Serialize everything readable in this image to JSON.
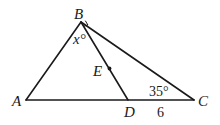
{
  "diagram": {
    "type": "geometry-triangle",
    "points": {
      "A": {
        "label": "A",
        "x": 26,
        "y": 100
      },
      "B": {
        "label": "B",
        "x": 81,
        "y": 22
      },
      "C": {
        "label": "C",
        "x": 194,
        "y": 100
      },
      "D": {
        "label": "D",
        "x": 128,
        "y": 100
      },
      "E": {
        "label": "E",
        "x": 109,
        "y": 68
      }
    },
    "segments": [
      "AB",
      "BC",
      "AC",
      "BD"
    ],
    "angles": {
      "ABD": {
        "label": "x°"
      },
      "DBC": {
        "label": "right-angle-mark"
      },
      "BCA": {
        "label": "35°"
      }
    },
    "lengths": {
      "DC": {
        "label": "6"
      }
    },
    "labels": {
      "A": "A",
      "B": "B",
      "C": "C",
      "D": "D",
      "E": "E",
      "angle_x": "x°",
      "angle_c": "35°",
      "length_dc": "6"
    }
  }
}
